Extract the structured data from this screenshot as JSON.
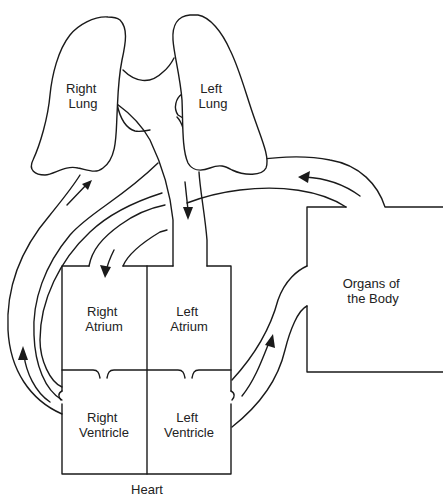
{
  "diagram": {
    "type": "circulatory-system",
    "title": "",
    "labels": {
      "right_lung": [
        "Right",
        "Lung"
      ],
      "left_lung": [
        "Left",
        "Lung"
      ],
      "right_atrium": [
        "Right",
        "Atrium"
      ],
      "left_atrium": [
        "Left",
        "Atrium"
      ],
      "right_ventricle": [
        "Right",
        "Ventricle"
      ],
      "left_ventricle": [
        "Left",
        "Ventricle"
      ],
      "organs": [
        "Organs of",
        "the Body"
      ],
      "heart": "Heart"
    },
    "colors": {
      "stroke": "#1a1a1a",
      "text": "#222222",
      "background": "#ffffff"
    },
    "flows": [
      {
        "from": "right_ventricle",
        "to": "right_lung",
        "direction": "up"
      },
      {
        "from": "left_lung",
        "to": "left_atrium",
        "direction": "down"
      },
      {
        "from": "left_ventricle",
        "to": "organs",
        "direction": "up"
      },
      {
        "from": "organs",
        "to": "right_atrium",
        "direction": "left-then-down"
      }
    ]
  }
}
